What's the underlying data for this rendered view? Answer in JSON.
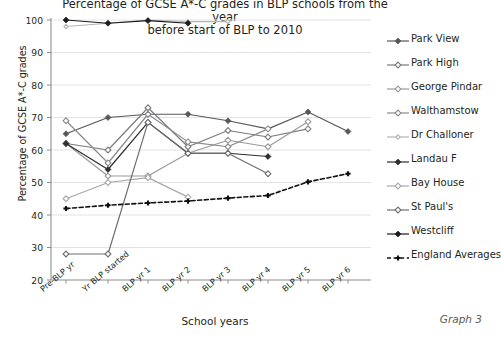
{
  "chart_data": {
    "type": "line",
    "title": "Percentage of GCSE A*-C grades in BLP schools from the year\nbefore start of BLP to 2010",
    "xlabel": "School years",
    "ylabel": "Percentage of GCSE A*-C grades",
    "categories": [
      "Pre-BLP yr",
      "Yr BLP started",
      "BLP yr 1",
      "BLP yr 2",
      "BLP yr 3",
      "BLP yr 4",
      "BLP yr 5",
      "BLP yr 6"
    ],
    "ylim": [
      20,
      100
    ],
    "yticks": [
      20,
      30,
      40,
      50,
      60,
      70,
      80,
      90,
      100
    ],
    "grid": true,
    "legend_position": "right",
    "annotation": "Graph 3",
    "series": [
      {
        "name": "Park View",
        "color": "#58585a",
        "marker": "filled-diamond",
        "dash": false,
        "values": [
          65,
          70,
          71,
          71,
          69,
          66.5,
          71.7,
          65.7
        ]
      },
      {
        "name": "Park High",
        "color": "#7b7b7e",
        "marker": "open-diamond",
        "dash": false,
        "values": [
          62,
          60,
          73,
          61,
          66,
          64,
          66.5,
          null
        ]
      },
      {
        "name": "George Pindar",
        "color": "#9a9a9c",
        "marker": "open-diamond",
        "dash": false,
        "values": [
          62,
          52,
          52,
          59,
          63,
          61,
          68.7,
          null
        ]
      },
      {
        "name": "Walthamstow",
        "color": "#8a8a8d",
        "marker": "open-diamond",
        "dash": false,
        "values": [
          69,
          56,
          71,
          62.5,
          61,
          66.5,
          null,
          null
        ]
      },
      {
        "name": "Dr Challoner",
        "color": "#b4b4b6",
        "marker": "open-diamond-small",
        "dash": false,
        "values": [
          98,
          99,
          100,
          99.5,
          99.5,
          null,
          null,
          null
        ]
      },
      {
        "name": "Landau F",
        "color": "#2e2e30",
        "marker": "filled-diamond",
        "dash": false,
        "values": [
          62,
          54,
          68.5,
          59,
          59,
          58,
          null,
          null
        ]
      },
      {
        "name": "Bay House",
        "color": "#a8a8aa",
        "marker": "open-diamond",
        "dash": false,
        "values": [
          45,
          50,
          51.5,
          45.5,
          null,
          null,
          null,
          null
        ]
      },
      {
        "name": "St Paul's",
        "color": "#6e6e71",
        "marker": "open-diamond",
        "dash": false,
        "values": [
          28,
          28,
          68.5,
          59,
          59,
          52.7,
          null,
          null
        ]
      },
      {
        "name": "Westcliff",
        "color": "#1c1c1e",
        "marker": "filled-diamond",
        "dash": false,
        "values": [
          100,
          99,
          99.8,
          99,
          null,
          null,
          null,
          null
        ]
      },
      {
        "name": "England Averages",
        "color": "#111113",
        "marker": "filled-plus",
        "dash": true,
        "values": [
          42,
          43,
          43.7,
          44.3,
          45.2,
          46,
          50.2,
          52.7
        ]
      }
    ]
  }
}
